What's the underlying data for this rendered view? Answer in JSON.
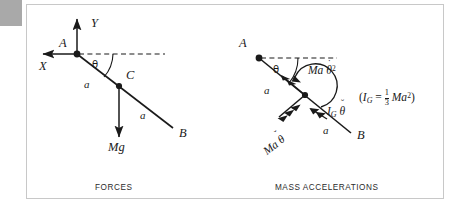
{
  "figure": {
    "panels": [
      {
        "id": "forces",
        "caption": "FORCES",
        "points": [
          {
            "name": "A",
            "label": "A"
          },
          {
            "name": "C",
            "label": "C"
          },
          {
            "name": "B",
            "label": "B"
          }
        ],
        "axes": [
          {
            "name": "y-axis",
            "label": "Y"
          },
          {
            "name": "x-axis",
            "label": "X"
          }
        ],
        "angle_label": "θ",
        "length_labels": [
          "a",
          "a"
        ],
        "force_label": "Mg"
      },
      {
        "id": "mass-accelerations",
        "caption": "MASS ACCELERATIONS",
        "points": [
          {
            "name": "A",
            "label": "A"
          },
          {
            "name": "B",
            "label": "B"
          }
        ],
        "angle_label": "θ",
        "length_labels": [
          "a",
          "a"
        ],
        "vectors": [
          {
            "name": "centripetal",
            "base": "Ma",
            "var": "θ",
            "overdot": "˙",
            "exponent": "2"
          },
          {
            "name": "tangential",
            "base": "Ma",
            "var": "θ",
            "overdot": "˘"
          },
          {
            "name": "moment",
            "base": "I",
            "subscript": "G",
            "var": "θ",
            "overdot": "˘"
          }
        ]
      }
    ],
    "formula": {
      "open": "(",
      "symbol": "I",
      "subscript": "G",
      "equals": "=",
      "numerator": "1",
      "denominator": "3",
      "term": "Ma",
      "exponent": "2",
      "close": ")"
    },
    "colors": {
      "ink": "#1a1a1a",
      "frame": "#c8c8c8",
      "corner_tab": "#a9a9a9",
      "background": "#ffffff"
    }
  }
}
